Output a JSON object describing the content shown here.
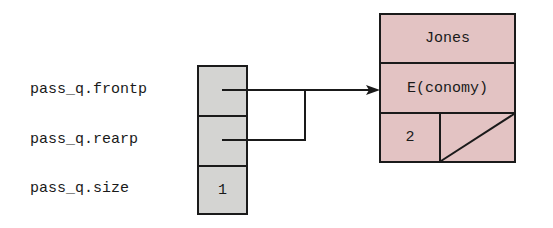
{
  "labels": {
    "frontp": "pass_q.frontp",
    "rearp": "pass_q.rearp",
    "size": "pass_q.size"
  },
  "queue_struct": {
    "frontp_value": "",
    "rearp_value": "",
    "size_value": "1"
  },
  "node": {
    "name": "Jones",
    "class": "E(conomy)",
    "count": "2",
    "next": "null"
  },
  "colors": {
    "queue_fill": "#d4d4d2",
    "node_fill": "#e3c3c3",
    "stroke": "#1a1a1a"
  }
}
